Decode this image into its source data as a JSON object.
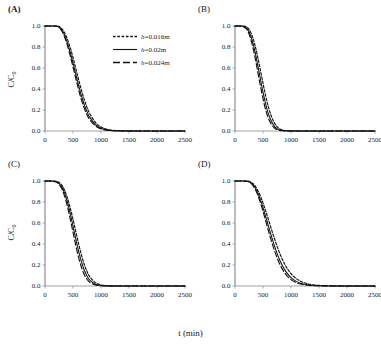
{
  "figure": {
    "xlabel": "t (min)",
    "ylabel_main": "C/C",
    "ylabel_sub": "0"
  },
  "legend": {
    "position": "inside-panel-A-top-right",
    "entries": [
      {
        "label_var": "h",
        "label": "h=0.016m",
        "style": "dotted",
        "name": "legend-item-h-0016"
      },
      {
        "label_var": "h",
        "label": "h=0.02m",
        "style": "solid",
        "name": "legend-item-h-002"
      },
      {
        "label_var": "h",
        "label": "h=0.024m",
        "style": "dashed",
        "name": "legend-item-h-0024"
      }
    ]
  },
  "panels": [
    {
      "id": "A",
      "label": "(A)",
      "bold": true
    },
    {
      "id": "B",
      "label": "(B)",
      "bold": false
    },
    {
      "id": "C",
      "label": "(C)",
      "bold": false
    },
    {
      "id": "D",
      "label": "(D)",
      "bold": false
    }
  ],
  "axes": {
    "x_ticks": [
      "0",
      "500",
      "1000",
      "1500",
      "2000",
      "2500"
    ],
    "x_tick_values": [
      0,
      500,
      1000,
      1500,
      2000,
      2500
    ],
    "y_ticks": [
      "0.0",
      "0.2",
      "0.4",
      "0.6",
      "0.8",
      "1.0"
    ],
    "y_tick_values": [
      0.0,
      0.2,
      0.4,
      0.6,
      0.8,
      1.0
    ],
    "xlim": [
      0,
      2500
    ],
    "ylim": [
      0.0,
      1.0
    ],
    "grid": false
  },
  "chart_data": [
    {
      "type": "line",
      "panel": "A",
      "title": "(A)",
      "xlabel": "t (min)",
      "ylabel": "C/C0",
      "xlim": [
        0,
        2500
      ],
      "ylim": [
        0,
        1
      ],
      "grid": false,
      "legend_position": "upper right",
      "x": [
        0,
        100,
        200,
        250,
        300,
        350,
        400,
        450,
        500,
        550,
        600,
        650,
        700,
        750,
        800,
        900,
        1000,
        1100,
        1200,
        1300,
        1400,
        1500,
        1750,
        2000,
        2250,
        2500
      ],
      "series": [
        {
          "name": "h=0.016m",
          "style": "dotted",
          "values": [
            1.0,
            1.0,
            1.0,
            0.995,
            0.975,
            0.935,
            0.875,
            0.795,
            0.7,
            0.595,
            0.49,
            0.39,
            0.3,
            0.225,
            0.165,
            0.082,
            0.038,
            0.017,
            0.008,
            0.004,
            0.002,
            0.001,
            0.0,
            0.0,
            0.0,
            0.0
          ]
        },
        {
          "name": "h=0.02m",
          "style": "solid",
          "values": [
            1.0,
            1.0,
            1.0,
            0.99,
            0.962,
            0.912,
            0.84,
            0.75,
            0.648,
            0.54,
            0.434,
            0.336,
            0.252,
            0.183,
            0.13,
            0.061,
            0.027,
            0.012,
            0.005,
            0.002,
            0.001,
            0.0,
            0.0,
            0.0,
            0.0,
            0.0
          ]
        },
        {
          "name": "h=0.024m",
          "style": "dashed",
          "values": [
            1.0,
            1.0,
            0.999,
            0.986,
            0.952,
            0.895,
            0.815,
            0.718,
            0.61,
            0.5,
            0.393,
            0.298,
            0.218,
            0.155,
            0.107,
            0.048,
            0.02,
            0.008,
            0.003,
            0.001,
            0.0,
            0.0,
            0.0,
            0.0,
            0.0,
            0.0
          ]
        }
      ]
    },
    {
      "type": "line",
      "panel": "B",
      "title": "(B)",
      "xlabel": "t (min)",
      "ylabel": "C/C0",
      "xlim": [
        0,
        2500
      ],
      "ylim": [
        0,
        1
      ],
      "grid": false,
      "x": [
        0,
        100,
        150,
        200,
        250,
        300,
        350,
        400,
        450,
        500,
        550,
        600,
        650,
        700,
        750,
        800,
        850,
        900,
        1000,
        1250,
        1500,
        2000,
        2500
      ],
      "series": [
        {
          "name": "h=0.016m",
          "style": "dotted",
          "values": [
            1.0,
            1.0,
            0.999,
            0.992,
            0.968,
            0.915,
            0.83,
            0.718,
            0.59,
            0.455,
            0.33,
            0.222,
            0.14,
            0.08,
            0.042,
            0.02,
            0.009,
            0.004,
            0.001,
            0.0,
            0.0,
            0.0,
            0.0
          ]
        },
        {
          "name": "h=0.02m",
          "style": "solid",
          "values": [
            1.0,
            1.0,
            0.997,
            0.983,
            0.946,
            0.875,
            0.772,
            0.644,
            0.505,
            0.37,
            0.252,
            0.158,
            0.092,
            0.048,
            0.023,
            0.01,
            0.004,
            0.002,
            0.0,
            0.0,
            0.0,
            0.0,
            0.0
          ]
        },
        {
          "name": "h=0.024m",
          "style": "dashed",
          "values": [
            1.0,
            0.999,
            0.994,
            0.974,
            0.925,
            0.84,
            0.722,
            0.583,
            0.44,
            0.308,
            0.198,
            0.117,
            0.063,
            0.031,
            0.013,
            0.005,
            0.002,
            0.001,
            0.0,
            0.0,
            0.0,
            0.0,
            0.0
          ]
        }
      ]
    },
    {
      "type": "line",
      "panel": "C",
      "title": "(C)",
      "xlabel": "t (min)",
      "ylabel": "C/C0",
      "xlim": [
        0,
        2500
      ],
      "ylim": [
        0,
        1
      ],
      "grid": false,
      "x": [
        0,
        100,
        200,
        250,
        300,
        350,
        400,
        450,
        500,
        550,
        600,
        650,
        700,
        750,
        800,
        900,
        1000,
        1100,
        1200,
        1400,
        1600,
        2000,
        2500
      ],
      "series": [
        {
          "name": "h=0.016m",
          "style": "dotted",
          "values": [
            1.0,
            1.0,
            0.997,
            0.986,
            0.96,
            0.912,
            0.84,
            0.745,
            0.635,
            0.518,
            0.402,
            0.296,
            0.207,
            0.138,
            0.088,
            0.032,
            0.011,
            0.004,
            0.001,
            0.0,
            0.0,
            0.0,
            0.0
          ]
        },
        {
          "name": "h=0.02m",
          "style": "solid",
          "values": [
            1.0,
            1.0,
            0.994,
            0.978,
            0.944,
            0.885,
            0.8,
            0.692,
            0.572,
            0.448,
            0.332,
            0.232,
            0.153,
            0.095,
            0.056,
            0.017,
            0.005,
            0.001,
            0.0,
            0.0,
            0.0,
            0.0,
            0.0
          ]
        },
        {
          "name": "h=0.024m",
          "style": "dashed",
          "values": [
            1.0,
            0.999,
            0.99,
            0.968,
            0.925,
            0.855,
            0.758,
            0.64,
            0.512,
            0.386,
            0.272,
            0.18,
            0.111,
            0.064,
            0.035,
            0.009,
            0.002,
            0.0,
            0.0,
            0.0,
            0.0,
            0.0,
            0.0
          ]
        }
      ]
    },
    {
      "type": "line",
      "panel": "D",
      "title": "(D)",
      "xlabel": "t (min)",
      "ylabel": "C/C0",
      "xlim": [
        0,
        2500
      ],
      "ylim": [
        0,
        1
      ],
      "grid": false,
      "x": [
        0,
        100,
        200,
        250,
        300,
        350,
        400,
        450,
        500,
        600,
        700,
        800,
        900,
        1000,
        1100,
        1200,
        1300,
        1400,
        1500,
        1700,
        2000,
        2250,
        2500
      ],
      "series": [
        {
          "name": "h=0.016m",
          "style": "dotted",
          "values": [
            1.0,
            1.0,
            1.0,
            0.997,
            0.985,
            0.96,
            0.918,
            0.862,
            0.792,
            0.628,
            0.458,
            0.31,
            0.196,
            0.118,
            0.068,
            0.038,
            0.021,
            0.011,
            0.006,
            0.002,
            0.0,
            0.0,
            0.0
          ]
        },
        {
          "name": "h=0.02m",
          "style": "solid",
          "values": [
            1.0,
            1.0,
            0.999,
            0.993,
            0.977,
            0.945,
            0.895,
            0.828,
            0.748,
            0.566,
            0.39,
            0.246,
            0.144,
            0.08,
            0.042,
            0.022,
            0.011,
            0.005,
            0.003,
            0.001,
            0.0,
            0.0,
            0.0
          ]
        },
        {
          "name": "h=0.024m",
          "style": "dashed",
          "values": [
            1.0,
            1.0,
            0.998,
            0.99,
            0.97,
            0.932,
            0.875,
            0.8,
            0.712,
            0.52,
            0.345,
            0.208,
            0.116,
            0.061,
            0.03,
            0.015,
            0.007,
            0.003,
            0.002,
            0.0,
            0.0,
            0.0,
            0.0
          ]
        }
      ]
    }
  ]
}
